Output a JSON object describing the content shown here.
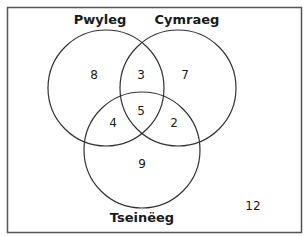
{
  "diagram": {
    "type": "venn-3",
    "colors": {
      "stroke": "#333333",
      "text": "#1a1a1a",
      "background": "#ffffff",
      "border": "#555555"
    },
    "sets": [
      {
        "name": "Pwyleg",
        "cx": 106,
        "cy": 88,
        "r": 58,
        "label_x": 106,
        "label_y": 24
      },
      {
        "name": "Cymraeg",
        "cx": 178,
        "cy": 88,
        "r": 58,
        "label_x": 185,
        "label_y": 24
      },
      {
        "name": "Tseinëeg",
        "cx": 142,
        "cy": 150,
        "r": 58,
        "label_x": 142,
        "label_y": 222
      }
    ],
    "regions": {
      "pwyleg_only": "8",
      "cymraeg_only": "7",
      "tseineeg_only": "9",
      "pwyleg_cymraeg": "3",
      "pwyleg_tseineeg": "4",
      "cymraeg_tseineeg": "2",
      "all_three": "5",
      "none": "12"
    }
  }
}
